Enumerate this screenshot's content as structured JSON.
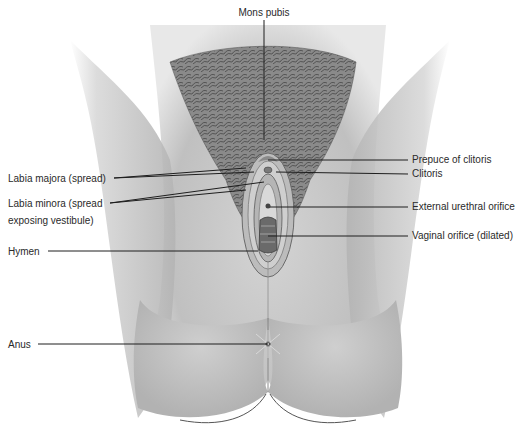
{
  "diagram": {
    "colors": {
      "background": "#ffffff",
      "skin_dark": "#9a9a9a",
      "skin_mid": "#c2c2c2",
      "skin_light": "#dcdcdc",
      "hair": "#5a5a5a",
      "label_text": "#2a2a2a",
      "leader_line": "#1e1e1e"
    },
    "labels": [
      {
        "id": "mons-pubis",
        "text": "Mons pubis",
        "side": "top",
        "x": 264,
        "y": 6,
        "line": [
          264,
          20,
          264,
          140
        ]
      },
      {
        "id": "prepuce-of-clitoris",
        "text": "Prepuce of clitoris",
        "side": "right",
        "x": 412,
        "y": 153,
        "line": [
          268,
          160,
          408,
          160
        ]
      },
      {
        "id": "clitoris",
        "text": "Clitoris",
        "side": "right",
        "x": 412,
        "y": 167,
        "line": [
          276,
          172,
          408,
          174
        ]
      },
      {
        "id": "labia-majora",
        "text": "Labia majora (spread)",
        "side": "left",
        "x": 8,
        "y": 174,
        "line": [
          114,
          178,
          246,
          168
        ],
        "line2": [
          114,
          178,
          254,
          172
        ]
      },
      {
        "id": "labia-minora-1",
        "text": "Labia minora (spread",
        "side": "left",
        "x": 8,
        "y": 199,
        "line": [
          110,
          203,
          246,
          190
        ],
        "line2": [
          110,
          203,
          264,
          182
        ]
      },
      {
        "id": "labia-minora-2",
        "text": "exposing vestibule)",
        "side": "left",
        "x": 8,
        "y": 216
      },
      {
        "id": "external-urethral-orifice",
        "text": "External urethral orifice",
        "side": "right",
        "x": 412,
        "y": 200,
        "line": [
          270,
          207,
          408,
          207
        ]
      },
      {
        "id": "vaginal-orifice",
        "text": "Vaginal orifice (dilated)",
        "side": "right",
        "x": 412,
        "y": 229,
        "line": [
          268,
          236,
          408,
          236
        ]
      },
      {
        "id": "hymen",
        "text": "Hymen",
        "side": "left",
        "x": 8,
        "y": 245,
        "line": [
          48,
          251,
          258,
          251
        ]
      },
      {
        "id": "anus",
        "text": "Anus",
        "side": "left",
        "x": 8,
        "y": 338,
        "line": [
          38,
          344,
          268,
          344
        ]
      }
    ]
  }
}
